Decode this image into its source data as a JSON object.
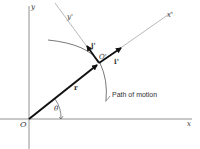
{
  "diagram": {
    "axes": {
      "x_label": "x",
      "y_label": "y",
      "origin_label": "O"
    },
    "moving_frame": {
      "origin_label": "O'",
      "x_prime_label": "x'",
      "y_prime_label": "y'",
      "i_prime_label": "i'",
      "j_prime_label": "j'"
    },
    "vectors": {
      "position_label": "r"
    },
    "angle_label": "θ",
    "path_label": "Path of motion",
    "colors": {
      "line": "#555555",
      "thick": "#111111",
      "background": "#ffffff"
    }
  }
}
